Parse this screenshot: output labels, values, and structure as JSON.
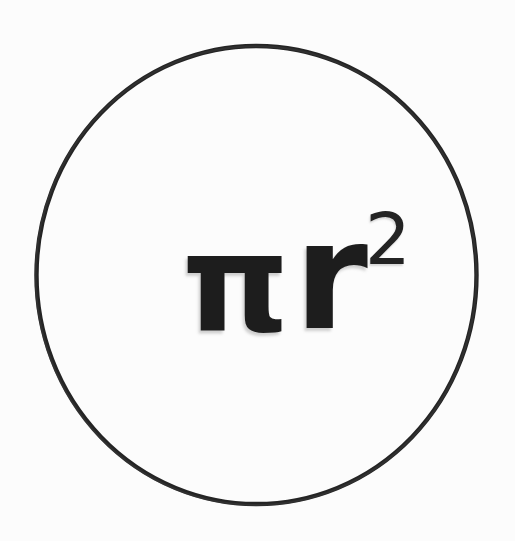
{
  "figure": {
    "background_color": "#fcfcfc",
    "ink_color": "#1d1d1d",
    "shadow_color": "#969696"
  },
  "shape": {
    "name": "circle",
    "stroke_color": "#222222",
    "stroke_width_px": 4,
    "fill": "none",
    "center_x_px": 257,
    "center_y_px": 275,
    "radius_x_px": 222,
    "radius_y_px": 230
  },
  "formula": {
    "full_text": "πr²",
    "base": "π",
    "variable": "r",
    "exponent": "2",
    "meaning": "pi r squared"
  }
}
